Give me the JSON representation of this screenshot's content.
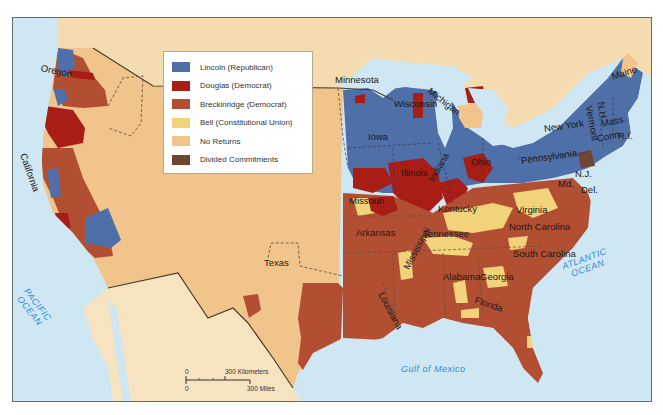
{
  "map": {
    "title": "Election of 1860",
    "legend": {
      "items": [
        {
          "label": "Lincoln (Republican)",
          "color": "#4f6fa8"
        },
        {
          "label": "Douglas (Democrat)",
          "color": "#a81e16"
        },
        {
          "label": "Breckinridge (Democrat)",
          "color": "#b24f33"
        },
        {
          "label": "Bell (Constitutional Union)",
          "color": "#f2d27a"
        },
        {
          "label": "No Returns",
          "color": "#f1c48c"
        },
        {
          "label": "Divided Commitments",
          "color": "#6e4530"
        }
      ]
    },
    "colors": {
      "water": "#cfe6f3",
      "no_returns": "#f1c48c",
      "foreign_land": "#f5dcb0",
      "mexico_land": "#f6e3c0",
      "border": "#4a3a2a"
    },
    "state_labels": [
      {
        "name": "Oregon",
        "x": 40,
        "y": 62,
        "rot": 12
      },
      {
        "name": "California",
        "x": 22,
        "y": 148,
        "rot": 70
      },
      {
        "name": "Texas",
        "x": 263,
        "y": 257,
        "rot": 0
      },
      {
        "name": "Minnesota",
        "x": 334,
        "y": 74,
        "rot": 0
      },
      {
        "name": "Wisconsin",
        "x": 393,
        "y": 98,
        "rot": 0
      },
      {
        "name": "Michigan",
        "x": 428,
        "y": 84,
        "rot": 38
      },
      {
        "name": "Iowa",
        "x": 367,
        "y": 131,
        "rot": 0
      },
      {
        "name": "Illinois",
        "x": 400,
        "y": 167,
        "rot": 0
      },
      {
        "name": "Indiana",
        "x": 430,
        "y": 175,
        "rot": -60
      },
      {
        "name": "Ohio",
        "x": 470,
        "y": 156,
        "rot": 0
      },
      {
        "name": "Missouri",
        "x": 348,
        "y": 195,
        "rot": 0
      },
      {
        "name": "Kentucky",
        "x": 437,
        "y": 203,
        "rot": 0
      },
      {
        "name": "Virginia",
        "x": 515,
        "y": 204,
        "rot": 0
      },
      {
        "name": "Tennessee",
        "x": 422,
        "y": 228,
        "rot": 0
      },
      {
        "name": "North Carolina",
        "x": 508,
        "y": 221,
        "rot": 0
      },
      {
        "name": "Arkansas",
        "x": 355,
        "y": 227,
        "rot": 0
      },
      {
        "name": "South Carolina",
        "x": 512,
        "y": 248,
        "rot": 0
      },
      {
        "name": "Mississippi",
        "x": 405,
        "y": 263,
        "rot": -62
      },
      {
        "name": "Alabama",
        "x": 442,
        "y": 271,
        "rot": 0
      },
      {
        "name": "Georgia",
        "x": 479,
        "y": 271,
        "rot": 0
      },
      {
        "name": "Louisiana",
        "x": 380,
        "y": 287,
        "rot": 62
      },
      {
        "name": "Florida",
        "x": 474,
        "y": 294,
        "rot": 18
      },
      {
        "name": "New York",
        "x": 543,
        "y": 123,
        "rot": -8
      },
      {
        "name": "Pennsylvania",
        "x": 520,
        "y": 155,
        "rot": -8
      },
      {
        "name": "Maine",
        "x": 611,
        "y": 71,
        "rot": -18
      },
      {
        "name": "N.H.",
        "x": 600,
        "y": 96,
        "rot": 80
      },
      {
        "name": "Vermont",
        "x": 588,
        "y": 100,
        "rot": 80
      },
      {
        "name": "Mass.",
        "x": 600,
        "y": 118,
        "rot": -12
      },
      {
        "name": "Conn.",
        "x": 596,
        "y": 133,
        "rot": -12
      },
      {
        "name": "R.I.",
        "x": 617,
        "y": 130,
        "rot": 0
      },
      {
        "name": "N.J.",
        "x": 574,
        "y": 168,
        "rot": 0
      },
      {
        "name": "Md.",
        "x": 557,
        "y": 178,
        "rot": 0
      },
      {
        "name": "Del.",
        "x": 580,
        "y": 184,
        "rot": 0
      }
    ],
    "water_labels": [
      {
        "name": "PACIFIC\nOCEAN",
        "x": 28,
        "y": 286,
        "rot": 52
      },
      {
        "name": "ATLANTIC\nOCEAN",
        "x": 560,
        "y": 262,
        "rot": -20
      },
      {
        "name": "Gulf of Mexico",
        "x": 400,
        "y": 364,
        "rot": 0
      }
    ],
    "scale": {
      "km_zero": "0",
      "km_label": "300 Kilometers",
      "mi_zero": "0",
      "mi_label": "300 Miles"
    }
  }
}
